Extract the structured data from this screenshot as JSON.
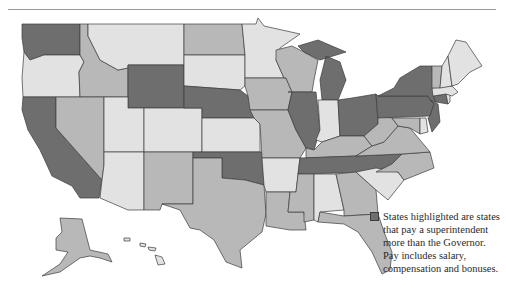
{
  "legend": {
    "swatch_color": "#6e6e6e",
    "text": "States highlighted are states that pay a superintendent more than the Governor. Pay includes salary, compensation and bonuses."
  },
  "colors": {
    "dark": "#6e6e6e",
    "medium": "#b8b8b8",
    "light": "#e2e2e2",
    "border": "#3c3c3c",
    "rule": "#9a9a9a"
  },
  "states": [
    {
      "id": "WA",
      "shade": "dark"
    },
    {
      "id": "OR",
      "shade": "light"
    },
    {
      "id": "CA",
      "shade": "dark"
    },
    {
      "id": "ID",
      "shade": "medium"
    },
    {
      "id": "NV",
      "shade": "medium"
    },
    {
      "id": "MT",
      "shade": "light"
    },
    {
      "id": "WY",
      "shade": "dark"
    },
    {
      "id": "UT",
      "shade": "light"
    },
    {
      "id": "AZ",
      "shade": "light"
    },
    {
      "id": "CO",
      "shade": "light"
    },
    {
      "id": "NM",
      "shade": "medium"
    },
    {
      "id": "ND",
      "shade": "medium"
    },
    {
      "id": "SD",
      "shade": "light"
    },
    {
      "id": "NE",
      "shade": "dark"
    },
    {
      "id": "KS",
      "shade": "light"
    },
    {
      "id": "OK",
      "shade": "dark"
    },
    {
      "id": "TX",
      "shade": "medium"
    },
    {
      "id": "MN",
      "shade": "light"
    },
    {
      "id": "IA",
      "shade": "medium"
    },
    {
      "id": "MO",
      "shade": "medium"
    },
    {
      "id": "AR",
      "shade": "light"
    },
    {
      "id": "LA",
      "shade": "medium"
    },
    {
      "id": "WI",
      "shade": "medium"
    },
    {
      "id": "IL",
      "shade": "dark"
    },
    {
      "id": "MI",
      "shade": "dark"
    },
    {
      "id": "IN",
      "shade": "light"
    },
    {
      "id": "OH",
      "shade": "dark"
    },
    {
      "id": "KY",
      "shade": "medium"
    },
    {
      "id": "TN",
      "shade": "dark"
    },
    {
      "id": "MS",
      "shade": "medium"
    },
    {
      "id": "AL",
      "shade": "light"
    },
    {
      "id": "GA",
      "shade": "medium"
    },
    {
      "id": "FL",
      "shade": "medium"
    },
    {
      "id": "SC",
      "shade": "light"
    },
    {
      "id": "NC",
      "shade": "medium"
    },
    {
      "id": "VA",
      "shade": "medium"
    },
    {
      "id": "WV",
      "shade": "medium"
    },
    {
      "id": "MD",
      "shade": "medium"
    },
    {
      "id": "DE",
      "shade": "light"
    },
    {
      "id": "PA",
      "shade": "dark"
    },
    {
      "id": "NJ",
      "shade": "dark"
    },
    {
      "id": "NY",
      "shade": "dark"
    },
    {
      "id": "CT",
      "shade": "dark"
    },
    {
      "id": "RI",
      "shade": "light"
    },
    {
      "id": "MA",
      "shade": "light"
    },
    {
      "id": "VT",
      "shade": "medium"
    },
    {
      "id": "NH",
      "shade": "light"
    },
    {
      "id": "ME",
      "shade": "light"
    },
    {
      "id": "AK",
      "shade": "medium"
    },
    {
      "id": "HI",
      "shade": "light"
    }
  ]
}
